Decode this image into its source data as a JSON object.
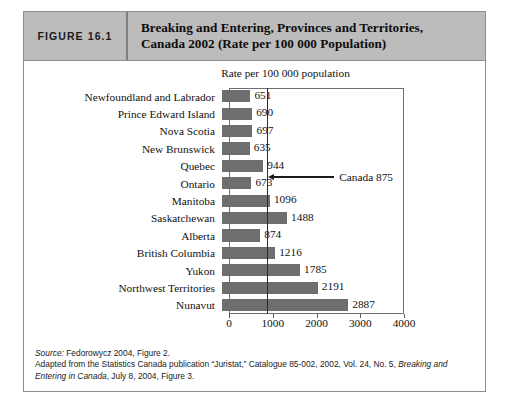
{
  "figure": {
    "number_label": "FIGURE 16.1",
    "title_line1": "Breaking and Entering, Provinces and Territories,",
    "title_line2": "Canada 2002 (Rate per 100 000 Population)"
  },
  "chart_data": {
    "type": "bar",
    "orientation": "horizontal",
    "title": "Breaking and Entering, Provinces and Territories, Canada 2002 (Rate per 100 000 Population)",
    "axis_caption": "Rate per 100 000 population",
    "xlabel": "",
    "ylabel": "",
    "xlim": [
      0,
      4000
    ],
    "xticks": [
      0,
      1000,
      2000,
      3000,
      4000
    ],
    "xtick_labels": [
      "0",
      "1000",
      "2000",
      "3000",
      "4000"
    ],
    "grid": false,
    "legend": "none",
    "bar_color": "#6e6e6e",
    "categories": [
      "Newfoundland and Labrador",
      "Prince Edward Island",
      "Nova Scotia",
      "New Brunswick",
      "Quebec",
      "Ontario",
      "Manitoba",
      "Saskatchewan",
      "Alberta",
      "British Columbia",
      "Yukon",
      "Northwest Territories",
      "Nunavut"
    ],
    "values": [
      651,
      690,
      697,
      635,
      944,
      673,
      1096,
      1488,
      874,
      1216,
      1785,
      2191,
      2887
    ],
    "value_labels": [
      "651",
      "690",
      "697",
      "635",
      "944",
      "673",
      "1096",
      "1488",
      "874",
      "1216",
      "1785",
      "2191",
      "2887"
    ],
    "reference_line": {
      "value": 875,
      "label": "Canada 875",
      "attached_to_category": "Ontario",
      "color": "#2b2b2b"
    }
  },
  "source": {
    "label": "Source:",
    "citation": " Fedorowycz 2004, Figure 2.",
    "adapted_prefix": "Adapted from the Statistics Canada publication “Juristat,” Catalogue 85-002, 2002, Vol. 24, No. 5, ",
    "adapted_italic": "Breaking and Entering in Canada",
    "adapted_suffix": ", July 8, 2004, Figure 3."
  }
}
